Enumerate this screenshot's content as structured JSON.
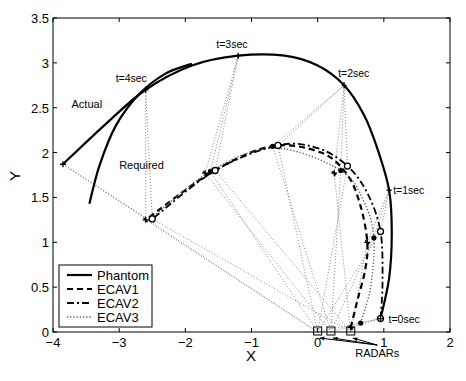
{
  "chart_data": {
    "type": "line",
    "title": "",
    "xlabel": "X",
    "ylabel": "Y",
    "xlim": [
      -4,
      2
    ],
    "ylim": [
      0,
      3.5
    ],
    "xticks": [
      -4,
      -3,
      -2,
      -1,
      0,
      1,
      2
    ],
    "yticks": [
      0,
      0.5,
      1,
      1.5,
      2,
      2.5,
      3,
      3.5
    ],
    "xtick_labels": [
      "−4",
      "−3",
      "−2",
      "−1",
      "0",
      "1",
      "2"
    ],
    "ytick_labels": [
      "0",
      "0.5",
      "1",
      "1.5",
      "2",
      "2.5",
      "3",
      "3.5"
    ],
    "grid": false,
    "legend": {
      "position": "lower left",
      "entries": [
        "Phantom",
        "ECAV1",
        "ECAV2",
        "ECAV3"
      ]
    },
    "series": [
      {
        "name": "Phantom",
        "style": "solid",
        "points": [
          [
            0.95,
            0.15
          ],
          [
            1.08,
            0.6
          ],
          [
            1.12,
            1.1
          ],
          [
            1.08,
            1.58
          ],
          [
            0.9,
            2.05
          ],
          [
            0.7,
            2.42
          ],
          [
            0.4,
            2.75
          ],
          [
            0.0,
            2.97
          ],
          [
            -0.5,
            3.08
          ],
          [
            -1.2,
            3.08
          ],
          [
            -1.9,
            2.97
          ],
          [
            -2.6,
            2.7
          ],
          [
            -3.2,
            2.32
          ],
          [
            -3.85,
            1.87
          ]
        ]
      },
      {
        "name": "Required",
        "style": "solid",
        "points": [
          [
            -3.45,
            1.43
          ],
          [
            -3.3,
            1.85
          ],
          [
            -3.05,
            2.3
          ],
          [
            -2.7,
            2.65
          ],
          [
            -2.3,
            2.88
          ],
          [
            -1.9,
            2.99
          ]
        ]
      },
      {
        "name": "ECAV1",
        "style": "dashed",
        "points": [
          [
            0.5,
            0.05
          ],
          [
            0.6,
            0.35
          ],
          [
            0.72,
            0.7
          ],
          [
            0.75,
            1.0
          ],
          [
            0.65,
            1.4
          ],
          [
            0.45,
            1.75
          ],
          [
            0.05,
            2.0
          ],
          [
            -0.7,
            2.07
          ],
          [
            -1.6,
            1.78
          ],
          [
            -2.6,
            1.25
          ]
        ]
      },
      {
        "name": "ECAV2",
        "style": "dashdot",
        "points": [
          [
            0.95,
            0.15
          ],
          [
            0.98,
            0.55
          ],
          [
            0.95,
            1.12
          ],
          [
            0.75,
            1.55
          ],
          [
            0.45,
            1.85
          ],
          [
            0.0,
            2.05
          ],
          [
            -0.6,
            2.08
          ],
          [
            -1.55,
            1.8
          ],
          [
            -2.5,
            1.26
          ]
        ]
      },
      {
        "name": "ECAV3",
        "style": "dotted",
        "points": [
          [
            0.65,
            0.1
          ],
          [
            0.8,
            0.5
          ],
          [
            0.85,
            1.05
          ],
          [
            0.7,
            1.45
          ],
          [
            0.35,
            1.8
          ],
          [
            -0.65,
            2.05
          ],
          [
            -1.6,
            1.8
          ],
          [
            -2.55,
            1.25
          ]
        ]
      }
    ],
    "markers": {
      "phantom_times": [
        {
          "label": "t=0sec",
          "x": 0.95,
          "y": 0.15
        },
        {
          "label": "t=1sec",
          "x": 1.08,
          "y": 1.58
        },
        {
          "label": "t=2sec",
          "x": 0.4,
          "y": 2.75
        },
        {
          "label": "t=3sec",
          "x": -1.2,
          "y": 3.08
        },
        {
          "label": "t=4sec",
          "x": -2.6,
          "y": 2.7
        }
      ],
      "ecav_points": [
        {
          "x": 0.95,
          "y": 0.15,
          "shape": "circle-open"
        },
        {
          "x": 0.65,
          "y": 0.1,
          "shape": "dot"
        },
        {
          "x": 0.5,
          "y": 0.05,
          "shape": "star"
        },
        {
          "x": 0.95,
          "y": 1.12,
          "shape": "circle-open"
        },
        {
          "x": 0.85,
          "y": 1.05,
          "shape": "dot"
        },
        {
          "x": 0.75,
          "y": 1.0,
          "shape": "star"
        },
        {
          "x": 0.45,
          "y": 1.85,
          "shape": "circle-open"
        },
        {
          "x": 0.35,
          "y": 1.8,
          "shape": "dot"
        },
        {
          "x": 0.25,
          "y": 1.77,
          "shape": "star"
        },
        {
          "x": -0.6,
          "y": 2.08,
          "shape": "circle-open"
        },
        {
          "x": -0.68,
          "y": 2.07,
          "shape": "dot"
        },
        {
          "x": -1.55,
          "y": 1.8,
          "shape": "circle-open"
        },
        {
          "x": -1.62,
          "y": 1.79,
          "shape": "dot"
        },
        {
          "x": -1.7,
          "y": 1.77,
          "shape": "star"
        },
        {
          "x": -2.5,
          "y": 1.26,
          "shape": "circle-open"
        },
        {
          "x": -2.6,
          "y": 1.25,
          "shape": "star"
        }
      ],
      "radars": [
        {
          "x": 0.0,
          "y": 0.0
        },
        {
          "x": 0.2,
          "y": 0.0
        },
        {
          "x": 0.5,
          "y": 0.0
        }
      ]
    },
    "annotations": [
      {
        "text": "Actual",
        "x": -3.72,
        "y": 2.5
      },
      {
        "text": "Required",
        "x": -3.0,
        "y": 1.82
      },
      {
        "text": "RADARs",
        "x": 0.9,
        "y": -0.35
      }
    ]
  }
}
